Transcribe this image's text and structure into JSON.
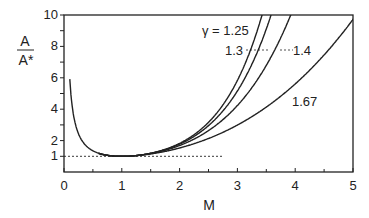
{
  "chart_data": {
    "type": "line",
    "title": "",
    "xlabel": "M",
    "ylabel_numerator": "A",
    "ylabel_denominator": "A*",
    "xlim": [
      0,
      5
    ],
    "ylim": [
      0,
      10
    ],
    "x_ticks": [
      0,
      1,
      2,
      3,
      4,
      5
    ],
    "x_minor_ticks": [
      0.5,
      1.5,
      2.5,
      3.5,
      4.5
    ],
    "y_ticks_labeled": [
      1,
      2,
      4,
      6,
      8,
      10
    ],
    "y_ticks": [
      1,
      2,
      3,
      4,
      5,
      6,
      7,
      8,
      9,
      10
    ],
    "grid": false,
    "reference_line": {
      "y": 1,
      "x_range": [
        0,
        2.75
      ],
      "style": "dashed"
    },
    "function": "A/A* = (1/M) * [(2/(γ+1)) * (1 + (γ-1)/2 * M^2)]^((γ+1)/(2(γ-1)))",
    "series": [
      {
        "name": "γ = 1.25",
        "gamma": 1.25,
        "label": "γ = 1.25"
      },
      {
        "name": "1.3",
        "gamma": 1.3,
        "label": "1.3"
      },
      {
        "name": "1.4",
        "gamma": 1.4,
        "label": "1.4"
      },
      {
        "name": "1.67",
        "gamma": 1.67,
        "label": "1.67"
      }
    ],
    "subsonic_branch": {
      "m_start": 0.1,
      "value_at_start": 5.8
    },
    "annotations": [
      {
        "text": "γ = 1.25",
        "target": "γ = 1.25"
      },
      {
        "text": "1.3",
        "target": "1.3",
        "leader": "dashed"
      },
      {
        "text": "1.4",
        "target": "1.4",
        "leader": "dashed"
      },
      {
        "text": "1.67",
        "target": "1.67"
      }
    ]
  }
}
